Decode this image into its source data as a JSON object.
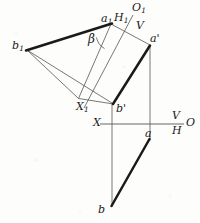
{
  "figure": {
    "background_color": "#fdfdfb",
    "ink_color": "#1a1a1a",
    "thin_color": "#555555",
    "labels": {
      "a1": {
        "base": "a",
        "sub": "1",
        "x": 101,
        "y": 13
      },
      "H1": {
        "base": "H",
        "sub": "1",
        "x": 114,
        "y": 13
      },
      "O1": {
        "base": "O",
        "sub": "1",
        "x": 133,
        "y": 7
      },
      "V_upper": {
        "base": "V",
        "sub": "",
        "x": 135,
        "y": 23
      },
      "b1": {
        "base": "b",
        "sub": "1",
        "x": 12,
        "y": 41
      },
      "beta": {
        "base": "β",
        "sub": "",
        "x": 89,
        "y": 35
      },
      "a_prime": {
        "base": "a'",
        "sub": "",
        "x": 148,
        "y": 38
      },
      "X1": {
        "base": "X",
        "sub": "1",
        "x": 78,
        "y": 103
      },
      "b_prime": {
        "base": "b'",
        "sub": "",
        "x": 116,
        "y": 105
      },
      "X": {
        "base": "X",
        "sub": "",
        "x": 95,
        "y": 118
      },
      "V_right": {
        "base": "V",
        "sub": "",
        "x": 174,
        "y": 113
      },
      "H_right": {
        "base": "H",
        "sub": "",
        "x": 174,
        "y": 127
      },
      "O": {
        "base": "O",
        "sub": "",
        "x": 187,
        "y": 119
      },
      "a_low": {
        "base": "a",
        "sub": "",
        "x": 146,
        "y": 131
      },
      "b_low": {
        "base": "b",
        "sub": "",
        "x": 98,
        "y": 207
      }
    },
    "points": {
      "a1": {
        "x": 111.0,
        "y": 24.0
      },
      "b1": {
        "x": 27.0,
        "y": 50.0
      },
      "a_prime": {
        "x": 150.0,
        "y": 45.0
      },
      "b_prime": {
        "x": 113.5,
        "y": 104.0
      },
      "O1_top": {
        "x": 133.0,
        "y": 16.0
      },
      "X1_end": {
        "x": 84.0,
        "y": 108.0
      },
      "X_left": {
        "x": 100.0,
        "y": 124.0
      },
      "O_right": {
        "x": 184.0,
        "y": 124.0
      },
      "a_low": {
        "x": 150.0,
        "y": 138.0
      },
      "b_low": {
        "x": 112.0,
        "y": 206.0
      },
      "vert_b_top": {
        "x": 112.0,
        "y": 104.0
      },
      "vert_b_bot": {
        "x": 112.0,
        "y": 206.0
      },
      "vert_a_top": {
        "x": 150.0,
        "y": 45.0
      },
      "vert_a_bot": {
        "x": 150.0,
        "y": 140.0
      },
      "aux_corner": {
        "x": 78.0,
        "y": 98.0
      }
    },
    "segments": [
      {
        "name": "b1-a1-true-length",
        "weight": "thick"
      },
      {
        "name": "b1-to-bprime-ray",
        "weight": "thin"
      },
      {
        "name": "b1-to-auxcorner",
        "weight": "thin"
      },
      {
        "name": "a1-to-aprime",
        "weight": "thin"
      },
      {
        "name": "aprime-bprime-front-view",
        "weight": "thick"
      },
      {
        "name": "a1-to-auxbase",
        "weight": "thin"
      },
      {
        "name": "O1-X1-axis",
        "weight": "thin"
      },
      {
        "name": "X-O-ground-line",
        "weight": "thin"
      },
      {
        "name": "vertical-through-b",
        "weight": "thin"
      },
      {
        "name": "vertical-through-a",
        "weight": "thin"
      },
      {
        "name": "b-a-top-view",
        "weight": "thick"
      },
      {
        "name": "beta-angle-arc",
        "weight": "thin"
      }
    ]
  }
}
